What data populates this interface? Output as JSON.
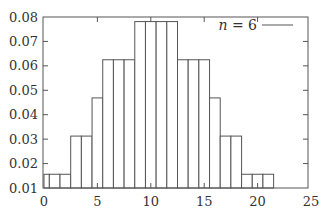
{
  "chart_data": {
    "type": "bar",
    "title": "",
    "xlabel": "",
    "ylabel": "",
    "xlim": [
      0,
      25
    ],
    "ylim": [
      0.01,
      0.08
    ],
    "grid": false,
    "legend_position": "top-right",
    "legend": [
      {
        "label": "n = 6",
        "style": "line",
        "color": "#555555"
      }
    ],
    "x_ticks": [
      "0",
      "5",
      "10",
      "15",
      "20",
      "25"
    ],
    "y_ticks": [
      "0.01",
      "0.02",
      "0.03",
      "0.04",
      "0.05",
      "0.06",
      "0.07",
      "0.08"
    ],
    "bar_width": 1,
    "categories": [
      0,
      1,
      2,
      3,
      4,
      5,
      6,
      7,
      8,
      9,
      10,
      11,
      12,
      13,
      14,
      15,
      16,
      17,
      18,
      19,
      20,
      21
    ],
    "series": [
      {
        "name": "n = 6",
        "values": [
          0.015625,
          0.015625,
          0.015625,
          0.03125,
          0.03125,
          0.046875,
          0.0625,
          0.0625,
          0.0625,
          0.078125,
          0.078125,
          0.078125,
          0.078125,
          0.0625,
          0.0625,
          0.0625,
          0.046875,
          0.03125,
          0.03125,
          0.015625,
          0.015625,
          0.015625
        ]
      }
    ]
  },
  "plot": {
    "px_left": 44,
    "px_right": 311,
    "x_min": 0,
    "x_max": 25,
    "px_bottom": 188,
    "px_top": 17,
    "y_min": 0.01,
    "y_max": 0.08,
    "frame": {
      "x": 43,
      "y": 17,
      "w": 265,
      "h": 171
    }
  }
}
